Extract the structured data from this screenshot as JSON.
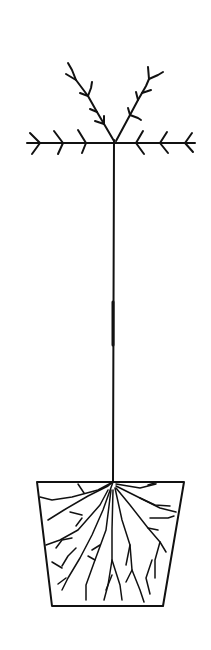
{
  "illustration": {
    "subject": "tree in a container (line drawing)",
    "background": "#ffffff",
    "ink_color": "#111111",
    "parts": {
      "crown": "branched crown with horizontal tier and two upward leaders",
      "trunk": "single straight stem",
      "pot": "trapezoid container with root system"
    }
  }
}
